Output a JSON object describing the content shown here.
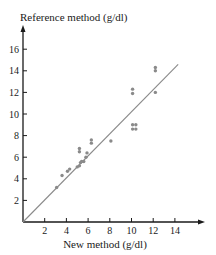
{
  "chart_data": {
    "type": "scatter",
    "title": "",
    "xlabel": "New method (g/dl)",
    "ylabel": "Reference method (g/dl)",
    "xlim": [
      0,
      16
    ],
    "ylim": [
      0,
      17
    ],
    "x_ticks": [
      2,
      4,
      6,
      8,
      10,
      12,
      14
    ],
    "y_ticks": [
      2,
      4,
      6,
      8,
      10,
      12,
      14,
      16
    ],
    "grid": false,
    "legend": null,
    "reference_line": {
      "label": "line of equality",
      "from": [
        0,
        0
      ],
      "to": [
        14.3,
        14.6
      ]
    },
    "series": [
      {
        "name": "measurements",
        "points": [
          [
            3.1,
            3.2
          ],
          [
            3.6,
            4.3
          ],
          [
            4.1,
            4.7
          ],
          [
            4.3,
            4.9
          ],
          [
            5.0,
            5.1
          ],
          [
            5.2,
            5.2
          ],
          [
            5.3,
            5.5
          ],
          [
            5.4,
            5.6
          ],
          [
            5.6,
            5.6
          ],
          [
            5.8,
            6.0
          ],
          [
            5.9,
            6.4
          ],
          [
            5.2,
            6.5
          ],
          [
            5.2,
            6.8
          ],
          [
            6.3,
            7.3
          ],
          [
            6.3,
            7.6
          ],
          [
            8.1,
            7.5
          ],
          [
            10.1,
            8.6
          ],
          [
            10.4,
            8.6
          ],
          [
            10.1,
            9.0
          ],
          [
            10.4,
            9.0
          ],
          [
            10.1,
            11.9
          ],
          [
            10.1,
            12.3
          ],
          [
            12.2,
            12.0
          ],
          [
            12.2,
            14.0
          ],
          [
            12.2,
            14.3
          ]
        ]
      }
    ]
  },
  "colors": {
    "axis": "#1a1a1a",
    "points": "#8a8a8a",
    "line": "#8a8a8a"
  }
}
